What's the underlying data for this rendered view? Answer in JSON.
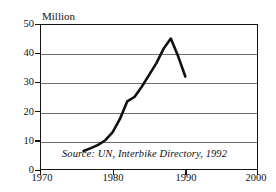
{
  "chart_data": {
    "type": "line",
    "title": "",
    "subtitle": "",
    "xlabel": "",
    "ylabel": "Million",
    "unit_label": "Million",
    "xlim": [
      1970,
      2000
    ],
    "ylim": [
      0,
      50
    ],
    "grid": true,
    "grid_axis": "y",
    "legend": false,
    "legend_position": "none",
    "x_ticks": [
      1970,
      1980,
      1990,
      2000
    ],
    "x_tick_labels": [
      "1970",
      "1980",
      "1990",
      "2000"
    ],
    "y_ticks": [
      0,
      10,
      20,
      30,
      40,
      50
    ],
    "y_tick_labels": [
      "0",
      "10",
      "20",
      "30",
      "40",
      "50"
    ],
    "line_color": "#111111",
    "grid_color": "#6e6e6e",
    "axis_color": "#141414",
    "background_color": "#ffffff",
    "annotations": [
      {
        "name": "source-note",
        "text": "Source: UN, Interbike Directory, 1992",
        "style": "italic"
      }
    ],
    "series": [
      {
        "name": "Bicycle production",
        "x": [
          1976,
          1977,
          1978,
          1979,
          1980,
          1981,
          1982,
          1983,
          1984,
          1985,
          1986,
          1987,
          1988,
          1989,
          1990
        ],
        "values": [
          6.5,
          7.5,
          8.6,
          10.2,
          13.0,
          17.5,
          23.5,
          25.0,
          28.5,
          32.5,
          36.5,
          41.5,
          45.0,
          39.0,
          32.0
        ]
      }
    ]
  },
  "axes": {
    "unit_label": "Million",
    "y_labels": [
      "50",
      "40",
      "30",
      "20",
      "10",
      "0"
    ],
    "x_labels": [
      "1970",
      "1980",
      "1990",
      "2000"
    ]
  },
  "source": {
    "text": "Source: UN, Interbike Directory, 1992"
  }
}
